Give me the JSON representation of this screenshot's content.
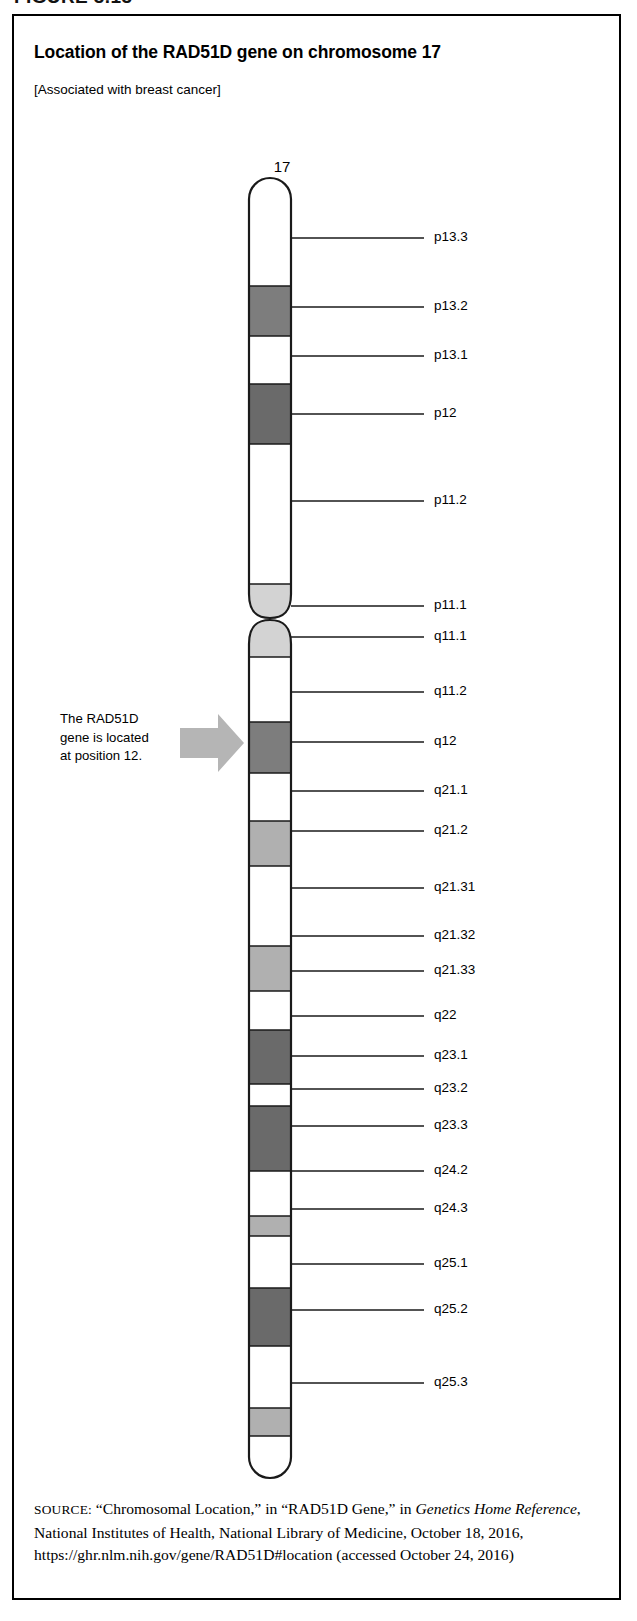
{
  "figure": {
    "caption": "FIGURE 3.13",
    "title": "Location of the RAD51D gene on chromosome 17",
    "subtitle": "[Associated with breast cancer]"
  },
  "chromosome": {
    "number_label": "17",
    "outline_color": "#1a1a1a",
    "fill_white": "#ffffff",
    "fill_light_gray": "#d3d3d3",
    "fill_mid_gray": "#b0b0b0",
    "fill_dark_gray": "#7d7d7d",
    "fill_darker_gray": "#6a6a6a"
  },
  "annotation": {
    "arrow_color": "#b3b3b3",
    "line1": "The RAD51D",
    "line2": "gene is located",
    "line3": "at position 12."
  },
  "chart_data": {
    "type": "ideogram",
    "title": "Location of the RAD51D gene on chromosome 17",
    "chromosome": "17",
    "highlighted_band": "q12",
    "highlight_note": "The RAD51D gene is located at position 12.",
    "axis": {
      "top_px": 170,
      "bottom_px": 1462,
      "left_px": 247,
      "right_px": 290
    },
    "bands": [
      {
        "name": "p13.3",
        "shade": "white",
        "y0": 170,
        "y1": 270,
        "labeled": true,
        "label_y": 222
      },
      {
        "name": "p13.2",
        "shade": "dark",
        "y0": 270,
        "y1": 320,
        "labeled": true,
        "label_y": 291
      },
      {
        "name": "p13.1",
        "shade": "white",
        "y0": 320,
        "y1": 368,
        "labeled": true,
        "label_y": 340
      },
      {
        "name": "p12",
        "shade": "darker",
        "y0": 368,
        "y1": 428,
        "labeled": true,
        "label_y": 398
      },
      {
        "name": "p11.2",
        "shade": "white",
        "y0": 428,
        "y1": 568,
        "labeled": true,
        "label_y": 485
      },
      {
        "name": "p11.1",
        "shade": "light",
        "y0": 568,
        "y1": 602,
        "labeled": true,
        "label_y": 590
      },
      {
        "name": "q11.1",
        "shade": "light",
        "y0": 604,
        "y1": 641,
        "labeled": true,
        "label_y": 621
      },
      {
        "name": "q11.2",
        "shade": "white",
        "y0": 641,
        "y1": 706,
        "labeled": true,
        "label_y": 676
      },
      {
        "name": "q12",
        "shade": "dark",
        "y0": 706,
        "y1": 757,
        "labeled": true,
        "label_y": 726
      },
      {
        "name": "q21.1",
        "shade": "white",
        "y0": 757,
        "y1": 805,
        "labeled": true,
        "label_y": 775
      },
      {
        "name": "q21.2",
        "shade": "mid",
        "y0": 805,
        "y1": 850,
        "labeled": true,
        "label_y": 815
      },
      {
        "name": "q21.31",
        "shade": "white",
        "y0": 850,
        "y1": 930,
        "labeled": true,
        "label_y": 872
      },
      {
        "name": "q21.32",
        "shade": "mid",
        "y0": 930,
        "y1": 975,
        "labeled": true,
        "label_y": 920
      },
      {
        "name": "q21.33",
        "shade": "white",
        "y0": 975,
        "y1": 1014,
        "labeled": true,
        "label_y": 955
      },
      {
        "name": "q22",
        "shade": "darker",
        "y0": 1014,
        "y1": 1068,
        "labeled": true,
        "label_y": 1000
      },
      {
        "name": "q23.1",
        "shade": "white",
        "y0": 1068,
        "y1": 1090,
        "labeled": true,
        "label_y": 1040
      },
      {
        "name": "q23.2",
        "shade": "darker",
        "y0": 1090,
        "y1": 1155,
        "labeled": true,
        "label_y": 1073
      },
      {
        "name": "q23.3",
        "shade": "white",
        "y0": 1155,
        "y1": 1200,
        "labeled": true,
        "label_y": 1110
      },
      {
        "name": "q24.1",
        "shade": "mid",
        "y0": 1200,
        "y1": 1220,
        "labeled": false,
        "label_y": null
      },
      {
        "name": "q24.2",
        "shade": "white",
        "y0": 1220,
        "y1": 1272,
        "labeled": true,
        "label_y": 1155
      },
      {
        "name": "q24.3",
        "shade": "darker",
        "y0": 1272,
        "y1": 1330,
        "labeled": true,
        "label_y": 1193
      },
      {
        "name": "q25.1",
        "shade": "white",
        "y0": 1330,
        "y1": 1392,
        "labeled": true,
        "label_y": 1248
      },
      {
        "name": "q25.2",
        "shade": "mid",
        "y0": 1392,
        "y1": 1420,
        "labeled": true,
        "label_y": 1294
      },
      {
        "name": "q25.3",
        "shade": "white",
        "y0": 1420,
        "y1": 1462,
        "labeled": true,
        "label_y": 1367
      }
    ],
    "labels": [
      {
        "text": "p13.3",
        "y": 222,
        "tick_y": 222
      },
      {
        "text": "p13.2",
        "y": 291,
        "tick_y": 291
      },
      {
        "text": "p13.1",
        "y": 340,
        "tick_y": 340
      },
      {
        "text": "p12",
        "y": 398,
        "tick_y": 398
      },
      {
        "text": "p11.2",
        "y": 485,
        "tick_y": 485
      },
      {
        "text": "p11.1",
        "y": 590,
        "tick_y": 590
      },
      {
        "text": "q11.1",
        "y": 621,
        "tick_y": 621
      },
      {
        "text": "q11.2",
        "y": 676,
        "tick_y": 676
      },
      {
        "text": "q12",
        "y": 726,
        "tick_y": 726
      },
      {
        "text": "q21.1",
        "y": 775,
        "tick_y": 775
      },
      {
        "text": "q21.2",
        "y": 815,
        "tick_y": 815
      },
      {
        "text": "q21.31",
        "y": 872,
        "tick_y": 872
      },
      {
        "text": "q21.32",
        "y": 920,
        "tick_y": 920
      },
      {
        "text": "q21.33",
        "y": 955,
        "tick_y": 955
      },
      {
        "text": "q22",
        "y": 1000,
        "tick_y": 1000
      },
      {
        "text": "q23.1",
        "y": 1040,
        "tick_y": 1040
      },
      {
        "text": "q23.2",
        "y": 1073,
        "tick_y": 1073
      },
      {
        "text": "q23.3",
        "y": 1110,
        "tick_y": 1110
      },
      {
        "text": "q24.2",
        "y": 1155,
        "tick_y": 1155
      },
      {
        "text": "q24.3",
        "y": 1193,
        "tick_y": 1193
      },
      {
        "text": "q25.1",
        "y": 1248,
        "tick_y": 1248
      },
      {
        "text": "q25.2",
        "y": 1294,
        "tick_y": 1294
      },
      {
        "text": "q25.3",
        "y": 1367,
        "tick_y": 1367
      }
    ]
  },
  "source": {
    "kicker": "SOURCE:",
    "part1": " “Chromosomal Location,” in “RAD51D Gene,” in ",
    "italic1": "Genetics Home Reference",
    "part2": ", National Institutes of Health, National Library of Medicine, October 18, 2016, https://ghr.nlm.nih.gov/gene/RAD51D#location (accessed October 24, 2016)"
  }
}
